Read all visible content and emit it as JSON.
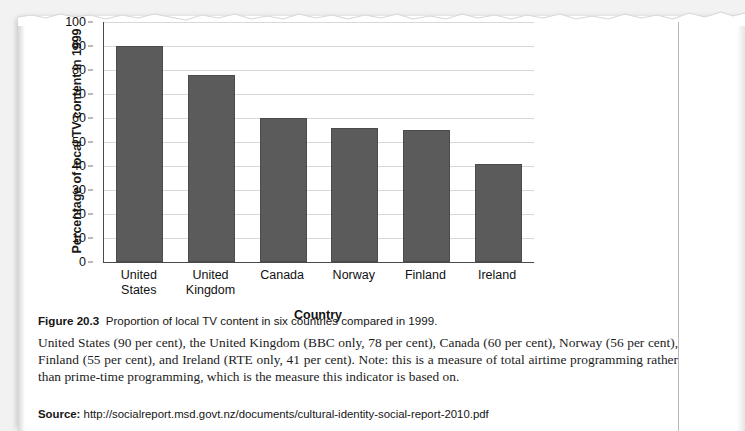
{
  "chart_data": {
    "type": "bar",
    "title": "",
    "xlabel": "Country",
    "ylabel": "Percentage of local TV content in 1999",
    "ylim": [
      0,
      100
    ],
    "ytick_step": 10,
    "yticks": [
      100,
      90,
      80,
      70,
      60,
      50,
      40,
      30,
      20,
      10,
      0
    ],
    "grid": true,
    "legend": "none",
    "bar_color": "#5b5b5b",
    "categories": [
      "United States",
      "United Kingdom",
      "Canada",
      "Norway",
      "Finland",
      "Ireland"
    ],
    "category_lines": [
      [
        "United",
        "States"
      ],
      [
        "United",
        "Kingdom"
      ],
      [
        "Canada",
        ""
      ],
      [
        "Norway",
        ""
      ],
      [
        "Finland",
        ""
      ],
      [
        "Ireland",
        ""
      ]
    ],
    "values": [
      90,
      78,
      60,
      56,
      55,
      41
    ]
  },
  "caption": {
    "label": "Figure 20.3",
    "text": "Proportion of local TV content in six countries compared in 1999."
  },
  "body": {
    "paragraph": "United States (90 per cent), the United Kingdom (BBC only, 78 per cent), Canada (60 per cent), Norway (56 per cent), Finland (55 per cent), and Ireland (RTE only, 41 per cent). Note: this is a measure of total airtime programming rather than prime-time programming, which is the measure this indicator is based on."
  },
  "source": {
    "label": "Source:",
    "url": "http://socialreport.msd.govt.nz/documents/cultural-identity-social-report-2010.pdf"
  }
}
